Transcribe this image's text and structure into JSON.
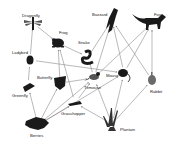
{
  "diagram": {
    "type": "food-web",
    "nodes": [
      {
        "id": "dragonfly",
        "label": "Dragonfly",
        "x": 33,
        "y": 23,
        "lx": 22,
        "ly": 14
      },
      {
        "id": "frog",
        "label": "Frog",
        "x": 58,
        "y": 43,
        "lx": 59,
        "ly": 31
      },
      {
        "id": "snake",
        "label": "Snake",
        "x": 88,
        "y": 57,
        "lx": 78,
        "ly": 41
      },
      {
        "id": "buzzard",
        "label": "Buzzard",
        "x": 112,
        "y": 20,
        "lx": 92,
        "ly": 13
      },
      {
        "id": "fox",
        "label": "Fox",
        "x": 152,
        "y": 23,
        "lx": 154,
        "ly": 13
      },
      {
        "id": "ladybird",
        "label": "Ladybird",
        "x": 30,
        "y": 60,
        "lx": 12,
        "ly": 51
      },
      {
        "id": "butterfly",
        "label": "Butterfly",
        "x": 60,
        "y": 83,
        "lx": 37,
        "ly": 76
      },
      {
        "id": "titmouse",
        "label": "Titmouse",
        "x": 94,
        "y": 78,
        "lx": 84,
        "ly": 86
      },
      {
        "id": "mouse",
        "label": "Mouse",
        "x": 124,
        "y": 73,
        "lx": 106,
        "ly": 74
      },
      {
        "id": "rabbit",
        "label": "Rabbit",
        "x": 152,
        "y": 80,
        "lx": 150,
        "ly": 90
      },
      {
        "id": "greenfly",
        "label": "Greenfly",
        "x": 28,
        "y": 86,
        "lx": 12,
        "ly": 94
      },
      {
        "id": "grasshopper",
        "label": "Grasshopper",
        "x": 75,
        "y": 103,
        "lx": 61,
        "ly": 112
      },
      {
        "id": "berries",
        "label": "Berries",
        "x": 38,
        "y": 125,
        "lx": 30,
        "ly": 134
      },
      {
        "id": "plantain",
        "label": "Plantain",
        "x": 112,
        "y": 124,
        "lx": 120,
        "ly": 128
      }
    ],
    "edges": [
      [
        "ladybird",
        "dragonfly"
      ],
      [
        "dragonfly",
        "frog"
      ],
      [
        "ladybird",
        "mouse"
      ],
      [
        "greenfly",
        "ladybird"
      ],
      [
        "berries",
        "greenfly"
      ],
      [
        "berries",
        "butterfly"
      ],
      [
        "berries",
        "titmouse"
      ],
      [
        "berries",
        "grasshopper"
      ],
      [
        "berries",
        "mouse"
      ],
      [
        "butterfly",
        "frog"
      ],
      [
        "grasshopper",
        "frog"
      ],
      [
        "frog",
        "snake"
      ],
      [
        "titmouse",
        "snake"
      ],
      [
        "snake",
        "buzzard"
      ],
      [
        "titmouse",
        "buzzard"
      ],
      [
        "mouse",
        "buzzard"
      ],
      [
        "mouse",
        "fox"
      ],
      [
        "rabbit",
        "fox"
      ],
      [
        "rabbit",
        "buzzard"
      ],
      [
        "titmouse",
        "fox"
      ],
      [
        "grasshopper",
        "titmouse"
      ],
      [
        "butterfly",
        "titmouse"
      ],
      [
        "plantain",
        "mouse"
      ],
      [
        "plantain",
        "rabbit"
      ],
      [
        "plantain",
        "grasshopper"
      ],
      [
        "plantain",
        "titmouse"
      ]
    ],
    "colors": {
      "line": "#8a8a8a",
      "ink": "#1a1a1a",
      "text": "#222222",
      "background": "#ffffff"
    }
  },
  "labels": {
    "dragonfly": "Dragonfly",
    "frog": "Frog",
    "snake": "Snake",
    "buzzard": "Buzzard",
    "fox": "Fox",
    "ladybird": "Ladybird",
    "butterfly": "Butterfly",
    "titmouse": "Titmouse",
    "mouse": "Mouse",
    "rabbit": "Rabbit",
    "greenfly": "Greenfly",
    "grasshopper": "Grasshopper",
    "berries": "Berries",
    "plantain": "Plantain"
  }
}
